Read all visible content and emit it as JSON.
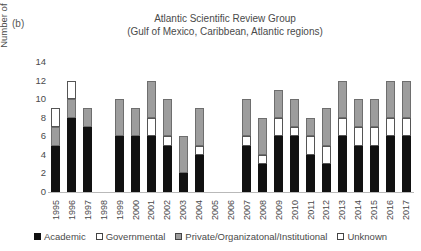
{
  "panel_label": "(b)",
  "title": {
    "line1": "Atlantic Scientific Review Group",
    "line2": "(Gulf of Mexico, Caribbean, Atlantic regions)"
  },
  "axes": {
    "ylabel": "Number of Representatives",
    "yticks": [
      "0",
      "2",
      "4",
      "6",
      "8",
      "10",
      "12",
      "14"
    ],
    "ymin": 0,
    "ymax": 14
  },
  "legend": [
    {
      "label": "Academic",
      "swatch": "academic",
      "color": "#111111"
    },
    {
      "label": "Governmental",
      "swatch": "gov",
      "color": "#ffffff"
    },
    {
      "label": "Private/Organizatonal/Institutional",
      "swatch": "priv",
      "color": "#9d9d9d"
    },
    {
      "label": "Unknown",
      "swatch": "unk",
      "color": "#ffffff"
    }
  ],
  "chart_data": {
    "type": "bar",
    "subtype": "stacked",
    "title": "Atlantic Scientific Review Group (Gulf of Mexico, Caribbean, Atlantic regions)",
    "xlabel": "",
    "ylabel": "Number of Representatives",
    "ylim": [
      0,
      14
    ],
    "ytick_step": 2,
    "grid": false,
    "legend_position": "bottom",
    "categories": [
      "1995",
      "1996",
      "1997",
      "1998",
      "1999",
      "2000",
      "2001",
      "2002",
      "2003",
      "2004",
      "2005",
      "2006",
      "2007",
      "2008",
      "2009",
      "2010",
      "2011",
      "2012",
      "2013",
      "2014",
      "2015",
      "2016",
      "2017"
    ],
    "series": [
      {
        "name": "Academic",
        "color": "#111111",
        "values": [
          5,
          8,
          7,
          0,
          6,
          6,
          6,
          5,
          2,
          4,
          0,
          0,
          5,
          3,
          6,
          6,
          4,
          3,
          6,
          5,
          5,
          6,
          6
        ]
      },
      {
        "name": "Governmental",
        "color": "#ffffff",
        "values": [
          0,
          0,
          0,
          0,
          0,
          0,
          2,
          1,
          0,
          1,
          0,
          0,
          1,
          1,
          2,
          1,
          2,
          2,
          2,
          2,
          2,
          2,
          2
        ]
      },
      {
        "name": "Private/Organizatonal/Institutional",
        "color": "#9d9d9d",
        "values": [
          2,
          2,
          2,
          0,
          4,
          3,
          4,
          4,
          4,
          4,
          0,
          0,
          4,
          4,
          3,
          3,
          2,
          4,
          4,
          3,
          3,
          4,
          4
        ]
      },
      {
        "name": "Unknown",
        "color": "#ffffff",
        "values": [
          2,
          2,
          0,
          0,
          0,
          0,
          0,
          0,
          0,
          0,
          0,
          0,
          0,
          0,
          0,
          0,
          0,
          0,
          0,
          0,
          0,
          0,
          0
        ]
      }
    ],
    "totals": [
      9,
      12,
      9,
      0,
      10,
      9,
      12,
      10,
      6,
      9,
      0,
      0,
      10,
      8,
      11,
      10,
      8,
      9,
      12,
      10,
      10,
      12,
      12
    ]
  }
}
